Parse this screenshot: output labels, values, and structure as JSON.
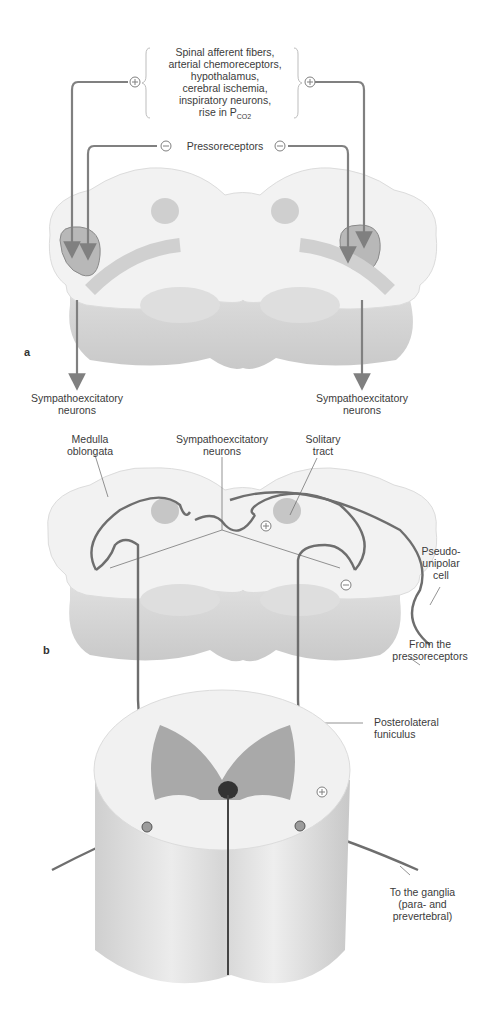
{
  "panel_a": {
    "letter": "a",
    "excitatory_inputs": [
      "Spinal afferent fibers,",
      "arterial chemoreceptors,",
      "hypothalamus,",
      "cerebral ischemia,",
      "inspiratory neurons,",
      "rise in P"
    ],
    "pco2_subscript": "CO2",
    "excitatory_sign": "+",
    "inhibitory_label": "Pressoreceptors",
    "inhibitory_sign": "−",
    "output_left": [
      "Sympathoexcitatory",
      "neurons"
    ],
    "output_right": [
      "Sympathoexcitatory",
      "neurons"
    ]
  },
  "panel_b": {
    "letter": "b",
    "labels": {
      "medulla": [
        "Medulla",
        "oblongata"
      ],
      "symp_neurons": [
        "Sympathoexcitatory",
        "neurons"
      ],
      "solitary_tract": [
        "Solitary",
        "tract"
      ],
      "pseudounipolar": [
        "Pseudo-",
        "unipolar",
        "cell"
      ],
      "from_pressoreceptors": [
        "From the",
        "pressoreceptors"
      ],
      "posterolateral": [
        "Posterolateral",
        "funiculus"
      ],
      "to_ganglia": [
        "To the ganglia",
        "(para- and",
        "prevertebral)"
      ]
    },
    "signs": {
      "solitary_plus": "+",
      "neuron_minus": "−",
      "spinal_plus": "+"
    }
  },
  "colors": {
    "stroke": "#7d7d7d",
    "tissue": "#efefef",
    "nucleus": "#bdbdbd",
    "gray_matter": "#a9a9a9"
  }
}
